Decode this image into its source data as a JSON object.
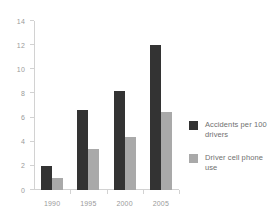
{
  "chart_data": {
    "type": "bar",
    "title": "",
    "xlabel": "",
    "ylabel": "",
    "categories": [
      "1990",
      "1995",
      "2000",
      "2005"
    ],
    "series": [
      {
        "name": "Accidents per 100 drivers",
        "color": "#333333",
        "values": [
          2.0,
          6.6,
          8.2,
          12.0
        ]
      },
      {
        "name": "Driver cell phone use",
        "color": "#a9a9a9",
        "values": [
          1.0,
          3.4,
          4.4,
          6.5
        ]
      }
    ],
    "ylim": [
      0,
      14
    ],
    "yticks": [
      0,
      2,
      4,
      6,
      8,
      10,
      12,
      14
    ],
    "ytick_labels": [
      "0",
      "2",
      "4",
      "6",
      "8",
      "10",
      "12",
      "14"
    ],
    "grid": false,
    "legend_position": "right"
  },
  "legend": {
    "items": [
      {
        "label": "Accidents per 100 drivers",
        "color": "#333333"
      },
      {
        "label": "Driver cell phone use",
        "color": "#a9a9a9"
      }
    ]
  }
}
